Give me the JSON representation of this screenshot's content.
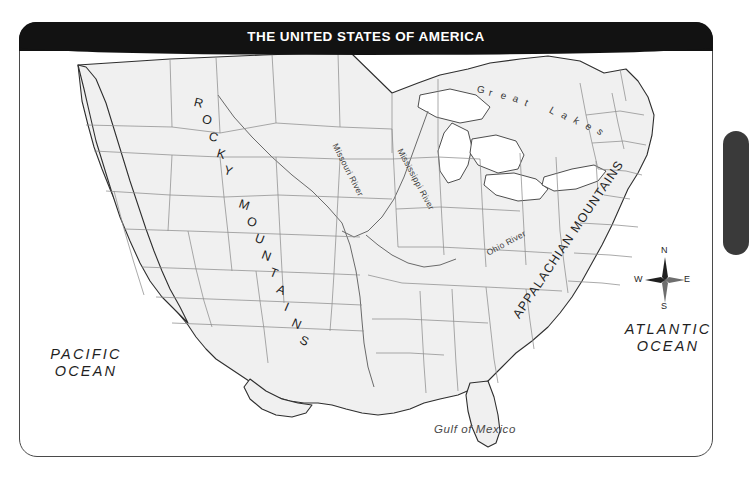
{
  "map": {
    "title": "THE UNITED STATES OF AMERICA",
    "frame": {
      "accent_color": "#121212",
      "land_color": "#f0f0f0",
      "water_color": "#ffffff",
      "border_color": "#4a4a4a"
    },
    "labels": {
      "oceans": [
        {
          "name": "pacific-ocean",
          "line1": "PACIFIC",
          "line2": "OCEAN"
        },
        {
          "name": "atlantic-ocean",
          "line1": "ATLANTIC",
          "line2": "OCEAN"
        }
      ],
      "gulf": "Gulf of Mexico",
      "great_lakes": "Great Lakes",
      "rivers": [
        {
          "name": "missouri-river",
          "text": "Missouri River"
        },
        {
          "name": "mississippi-river",
          "text": "Mississippi River"
        },
        {
          "name": "ohio-river",
          "text": "Ohio River"
        }
      ],
      "mountains": [
        {
          "name": "rocky-mountains",
          "text": "ROCKY MOUNTAINS"
        },
        {
          "name": "appalachian-mountains",
          "text": "APPALACHIAN MOUNTAINS"
        }
      ]
    },
    "compass": {
      "north": "N",
      "east": "E",
      "south": "S",
      "west": "W"
    }
  }
}
